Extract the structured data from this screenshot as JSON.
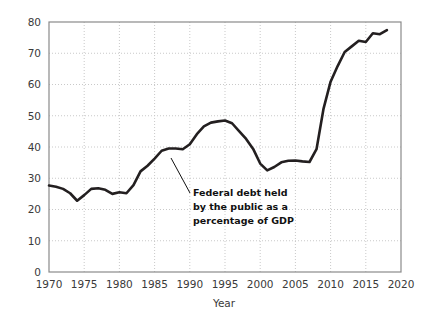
{
  "chart_data": {
    "type": "line",
    "title": "",
    "xlabel": "Year",
    "ylabel": "Percent of GDP",
    "xlim": [
      1970,
      2020
    ],
    "ylim": [
      0,
      80
    ],
    "grid": true,
    "legend": "none",
    "xticks": [
      "1970",
      "1975",
      "1980",
      "1985",
      "1990",
      "1995",
      "2000",
      "2005",
      "2010",
      "2015",
      "2020"
    ],
    "yticks": [
      "0",
      "10",
      "20",
      "30",
      "40",
      "50",
      "60",
      "70",
      "80"
    ],
    "series": [
      {
        "name": "Federal debt held by the public as a percentage of GDP",
        "color": "#231f20",
        "x": [
          1970,
          1971,
          1972,
          1973,
          1974,
          1975,
          1976,
          1977,
          1978,
          1979,
          1980,
          1981,
          1982,
          1983,
          1984,
          1985,
          1986,
          1987,
          1988,
          1989,
          1990,
          1991,
          1992,
          1993,
          1994,
          1995,
          1996,
          1997,
          1998,
          1999,
          2000,
          2001,
          2002,
          2003,
          2004,
          2005,
          2006,
          2007,
          2008,
          2009,
          2010,
          2011,
          2012,
          2013,
          2014,
          2015,
          2016,
          2017,
          2018
        ],
        "values": [
          27.7,
          27.3,
          26.6,
          25.2,
          22.8,
          24.6,
          26.6,
          26.8,
          26.3,
          25.0,
          25.5,
          25.2,
          27.8,
          32.2,
          34.0,
          36.3,
          38.8,
          39.5,
          39.5,
          39.3,
          40.9,
          44.1,
          46.6,
          47.8,
          48.2,
          48.5,
          47.6,
          45.1,
          42.6,
          39.4,
          34.7,
          32.5,
          33.6,
          35.1,
          35.6,
          35.7,
          35.4,
          35.2,
          39.3,
          52.3,
          60.9,
          65.9,
          70.4,
          72.2,
          74.0,
          73.6,
          76.4,
          76.1,
          77.4
        ]
      }
    ],
    "annotation": {
      "lines": [
        "Federal debt held",
        "by the public as a",
        "percentage of GDP"
      ],
      "leader_from": [
        171,
        158
      ],
      "leader_to": [
        190,
        193
      ]
    },
    "colors": {
      "line": "#231f20",
      "grid": "#c9c9c9",
      "frame": "#8a8a8a",
      "text": "#3a3a3a",
      "background": "#ffffff"
    }
  }
}
